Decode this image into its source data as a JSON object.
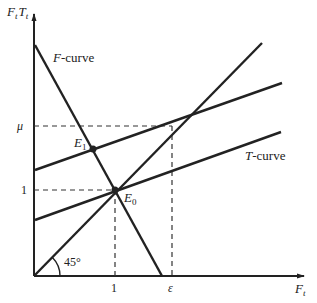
{
  "diagram": {
    "y_axis_label": {
      "main": "F",
      "sub1": "t",
      "sep": "T",
      "sub2": "t"
    },
    "x_axis_label": {
      "main": "F",
      "sub": "t"
    },
    "curves": {
      "f_curve": {
        "label_italic": "F",
        "label_rest": "-curve"
      },
      "t_curve": {
        "label_italic": "T",
        "label_rest": "-curve"
      },
      "line_45": {
        "angle_label": "45°"
      },
      "upper_line": {
        "label": ""
      }
    },
    "points": {
      "e0": {
        "main": "E",
        "sub": "0"
      },
      "e1": {
        "main": "E",
        "sub": "1"
      }
    },
    "ticks": {
      "y_mu": "μ",
      "y_one": "1",
      "x_one": "1",
      "x_epsilon": "ε"
    },
    "colors": {
      "ink": "#222222",
      "background": "#ffffff"
    }
  }
}
